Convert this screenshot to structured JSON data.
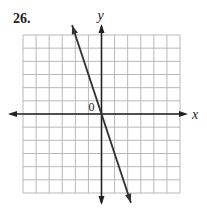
{
  "problem": {
    "label": "26."
  },
  "chart_data": {
    "type": "line",
    "title": "",
    "xlabel": "x",
    "ylabel": "y",
    "origin_label": "0",
    "xlim": [
      -6,
      6
    ],
    "ylim": [
      -6,
      6
    ],
    "grid": true,
    "grid_step": 1,
    "series": [
      {
        "name": "line",
        "equation": "y = -3x",
        "x": [
          -2,
          0,
          2
        ],
        "y": [
          6,
          0,
          -6
        ]
      }
    ]
  },
  "colors": {
    "grid": "#b8b8b8",
    "axis": "#222222",
    "line": "#333333"
  }
}
